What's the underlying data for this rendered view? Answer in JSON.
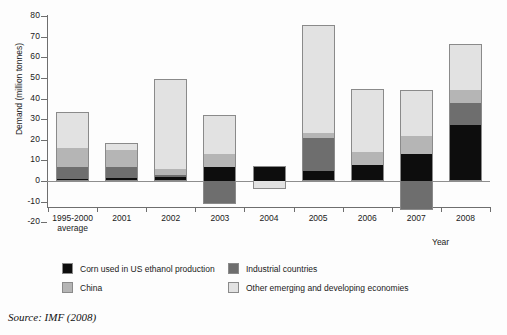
{
  "chart_data": {
    "type": "bar",
    "stacked": true,
    "title": "",
    "xlabel": "Year",
    "ylabel": "Demand (million tonnes)",
    "ylim": [
      -20,
      80
    ],
    "yticks": [
      80,
      70,
      60,
      50,
      40,
      30,
      20,
      10,
      0,
      -10,
      -20
    ],
    "grid": false,
    "legend_position": "bottom",
    "categories": [
      "1995-2000\naverage",
      "2001",
      "2002",
      "2003",
      "2004",
      "2005",
      "2006",
      "2007",
      "2008"
    ],
    "category_labels": [
      {
        "line1": "1995-2000",
        "line2": "average"
      },
      {
        "line1": "2001",
        "line2": ""
      },
      {
        "line1": "2002",
        "line2": ""
      },
      {
        "line1": "2003",
        "line2": ""
      },
      {
        "line1": "2004",
        "line2": ""
      },
      {
        "line1": "2005",
        "line2": ""
      },
      {
        "line1": "2006",
        "line2": ""
      },
      {
        "line1": "2007",
        "line2": ""
      },
      {
        "line1": "2008",
        "line2": ""
      }
    ],
    "series": [
      {
        "name": "Corn used in US ethanol production",
        "color": "#0d0d0d",
        "values": [
          1.0,
          1.5,
          2.0,
          7.0,
          7.0,
          5.0,
          8.0,
          13.0,
          27.0
        ]
      },
      {
        "name": "Industrial countries",
        "color": "#6e6e6e",
        "values": [
          6.0,
          5.5,
          1.0,
          -11.0,
          0.0,
          16.0,
          0.0,
          -14.0,
          11.0
        ]
      },
      {
        "name": "China",
        "color": "#b5b5b5",
        "values": [
          9.0,
          8.0,
          3.0,
          6.0,
          0.5,
          2.0,
          6.0,
          9.0,
          6.0
        ]
      },
      {
        "name": "Other emerging and developing economies",
        "color": "#e2e2e2",
        "values": [
          17.5,
          3.5,
          43.5,
          19.0,
          -4.0,
          52.0,
          30.5,
          22.0,
          22.5
        ]
      }
    ],
    "totals_positive": [
      33.5,
      18.5,
      49.5,
      32.0,
      7.5,
      75.5,
      44.5,
      44.0,
      66.5
    ],
    "totals_negative": [
      0,
      0,
      0,
      -11.0,
      -4.0,
      0,
      0,
      -14.0,
      0
    ],
    "bar_segments": [
      {
        "category": "1995-2000 average",
        "segments": [
          {
            "series": "Corn used in US ethanol production",
            "from": 0,
            "to": 1.0
          },
          {
            "series": "Industrial countries",
            "from": 1.0,
            "to": 7.0
          },
          {
            "series": "China",
            "from": 7.0,
            "to": 16.0
          },
          {
            "series": "Other emerging and developing economies",
            "from": 16.0,
            "to": 33.5
          }
        ]
      },
      {
        "category": "2001",
        "segments": [
          {
            "series": "Corn used in US ethanol production",
            "from": 0,
            "to": 1.5
          },
          {
            "series": "Industrial countries",
            "from": 1.5,
            "to": 7.0
          },
          {
            "series": "China",
            "from": 7.0,
            "to": 15.0
          },
          {
            "series": "Other emerging and developing economies",
            "from": 15.0,
            "to": 18.5
          }
        ]
      },
      {
        "category": "2002",
        "segments": [
          {
            "series": "Corn used in US ethanol production",
            "from": 0,
            "to": 2.0
          },
          {
            "series": "Industrial countries",
            "from": 2.0,
            "to": 3.0
          },
          {
            "series": "China",
            "from": 3.0,
            "to": 6.0
          },
          {
            "series": "Other emerging and developing economies",
            "from": 6.0,
            "to": 49.5
          }
        ]
      },
      {
        "category": "2003",
        "segments": [
          {
            "series": "Industrial countries",
            "from": -11.0,
            "to": 0
          },
          {
            "series": "Corn used in US ethanol production",
            "from": 0,
            "to": 7.0
          },
          {
            "series": "China",
            "from": 7.0,
            "to": 13.0
          },
          {
            "series": "Other emerging and developing economies",
            "from": 13.0,
            "to": 32.0
          }
        ]
      },
      {
        "category": "2004",
        "segments": [
          {
            "series": "Other emerging and developing economies",
            "from": -4.0,
            "to": 0
          },
          {
            "series": "Corn used in US ethanol production",
            "from": 0,
            "to": 7.0
          },
          {
            "series": "China",
            "from": 7.0,
            "to": 7.5
          }
        ]
      },
      {
        "category": "2005",
        "segments": [
          {
            "series": "Corn used in US ethanol production",
            "from": 0,
            "to": 5.0
          },
          {
            "series": "Industrial countries",
            "from": 5.0,
            "to": 21.0
          },
          {
            "series": "China",
            "from": 21.0,
            "to": 23.5
          },
          {
            "series": "Other emerging and developing economies",
            "from": 23.5,
            "to": 75.5
          }
        ]
      },
      {
        "category": "2006",
        "segments": [
          {
            "series": "Corn used in US ethanol production",
            "from": 0,
            "to": 8.0
          },
          {
            "series": "China",
            "from": 8.0,
            "to": 14.0
          },
          {
            "series": "Other emerging and developing economies",
            "from": 14.0,
            "to": 44.5
          }
        ]
      },
      {
        "category": "2007",
        "segments": [
          {
            "series": "Industrial countries",
            "from": -14.0,
            "to": 0
          },
          {
            "series": "Corn used in US ethanol production",
            "from": 0,
            "to": 13.0
          },
          {
            "series": "China",
            "from": 13.0,
            "to": 22.0
          },
          {
            "series": "Other emerging and developing economies",
            "from": 22.0,
            "to": 44.0
          }
        ]
      },
      {
        "category": "2008",
        "segments": [
          {
            "series": "Corn used in US ethanol production",
            "from": 0,
            "to": 27.0
          },
          {
            "series": "Industrial countries",
            "from": 27.0,
            "to": 38.0
          },
          {
            "series": "China",
            "from": 38.0,
            "to": 44.0
          },
          {
            "series": "Other emerging and developing economies",
            "from": 44.0,
            "to": 66.5
          }
        ]
      }
    ]
  },
  "legend": {
    "items": [
      {
        "label": "Corn used in US ethanol production",
        "color": "#0d0d0d"
      },
      {
        "label": "Industrial countries",
        "color": "#6e6e6e"
      },
      {
        "label": "China",
        "color": "#b5b5b5"
      },
      {
        "label": "Other emerging and developing economies",
        "color": "#e2e2e2"
      }
    ]
  },
  "source": {
    "text": "Source: IMF (2008)"
  }
}
